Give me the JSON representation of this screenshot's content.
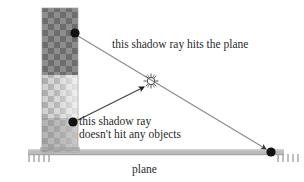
{
  "figure": {
    "title_label": "plane",
    "background_color": "#ffffff",
    "width": 304,
    "height": 182
  },
  "annotations": {
    "hits_plane": "this shadow ray hits the plane",
    "misses_line1": "this shadow ray",
    "misses_line2": "doesn't hit any objects"
  },
  "scene": {
    "ground": {
      "name": "plane",
      "color": "#b4b4b4",
      "edge_color": "#9a9a9a",
      "y": 152,
      "x_start": 28,
      "x_end": 282,
      "thickness": 6,
      "hatch_color": "#a8a8a8",
      "hatch_count_left": 6,
      "hatch_count_right": 6
    },
    "column": {
      "name": "occluder-box",
      "x": 42,
      "y": 8,
      "width": 36,
      "height": 144,
      "shadow_color": "#8d8d8d",
      "lit_color": "#d8d8d8",
      "checker_dark": "#6f6f6f",
      "checker_light": "#9b9b9b",
      "split_y": 75
    },
    "light": {
      "name": "point-light",
      "x": 151,
      "y": 81,
      "color": "#4a4a4a",
      "ray_count": 12,
      "radius": 4.2
    },
    "points": [
      {
        "name": "surface-point-upper",
        "x": 75,
        "y": 33,
        "radius": 4.6,
        "color": "#111111"
      },
      {
        "name": "surface-point-lower",
        "x": 73,
        "y": 122,
        "radius": 4.6,
        "color": "#111111"
      },
      {
        "name": "surface-point-ground",
        "x": 271,
        "y": 152,
        "radius": 4.6,
        "color": "#111111"
      }
    ],
    "rays": [
      {
        "name": "shadow-ray-blocked",
        "from_x": 78,
        "from_y": 36,
        "to_x": 268,
        "to_y": 150,
        "color": "#7a7a7a",
        "arrow": true,
        "note": "this shadow ray hits the plane"
      },
      {
        "name": "shadow-ray-unblocked",
        "from_x": 78,
        "from_y": 120,
        "to_x": 145,
        "to_y": 86,
        "color": "#4a4a4a",
        "arrow": true,
        "note": "doesn't hit any objects"
      }
    ]
  }
}
